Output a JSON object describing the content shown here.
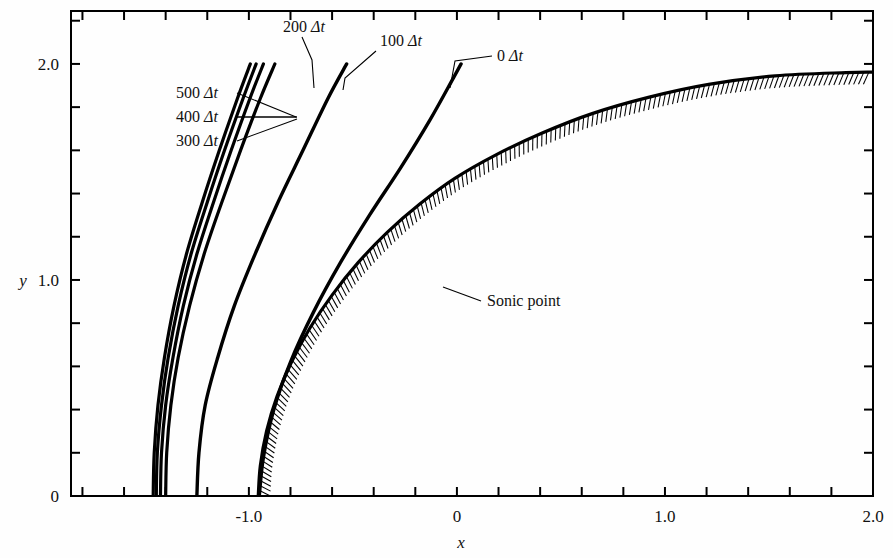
{
  "figure": {
    "background": "#fefefe",
    "ink": "#000000"
  },
  "axes": {
    "x_label": "x",
    "y_label": "y",
    "x_ticklabels": [
      "-1.0",
      "0",
      "1.0",
      "2.0"
    ],
    "x_tickvalues": [
      -1.0,
      0,
      1.0,
      2.0
    ],
    "y_ticklabels": [
      "0",
      "1.0",
      "2.0"
    ],
    "y_tickvalues": [
      0,
      1.0,
      2.0
    ],
    "x_min": -1.855,
    "x_max": 2.0,
    "y_min": 0,
    "y_max": 2.245,
    "x_minor_step": 0.2,
    "y_minor_step": 0.2,
    "frame": true,
    "ticks_inward": false
  },
  "annotations": {
    "sonic_point": "Sonic point",
    "shock_labels": [
      {
        "id": "t0",
        "text": "0 Δt"
      },
      {
        "id": "t100",
        "text": "100 Δt"
      },
      {
        "id": "t200",
        "text": "200 Δt"
      },
      {
        "id": "t300",
        "text": "300 Δt"
      },
      {
        "id": "t400",
        "text": "400 Δt"
      },
      {
        "id": "t500",
        "text": "500 Δt"
      }
    ]
  },
  "chart_data": {
    "type": "line",
    "title": "",
    "xlabel": "x",
    "ylabel": "y",
    "xlim": [
      -1.855,
      2.0
    ],
    "ylim": [
      0,
      2.245
    ],
    "grid": false,
    "legend": "inline-annotations",
    "series": [
      {
        "name": "0 Δt",
        "label_text": "0 Δt",
        "points": [
          [
            -0.95,
            0.0
          ],
          [
            -0.93,
            0.18
          ],
          [
            -0.88,
            0.4
          ],
          [
            -0.8,
            0.62
          ],
          [
            -0.69,
            0.85
          ],
          [
            -0.56,
            1.08
          ],
          [
            -0.42,
            1.3
          ],
          [
            -0.27,
            1.52
          ],
          [
            -0.13,
            1.74
          ],
          [
            -0.02,
            1.93
          ],
          [
            0.02,
            2.0
          ]
        ]
      },
      {
        "name": "100 Δt",
        "label_text": "100 Δt",
        "points": [
          [
            -1.25,
            0.0
          ],
          [
            -1.24,
            0.2
          ],
          [
            -1.21,
            0.42
          ],
          [
            -1.15,
            0.64
          ],
          [
            -1.07,
            0.88
          ],
          [
            -0.97,
            1.12
          ],
          [
            -0.86,
            1.36
          ],
          [
            -0.74,
            1.6
          ],
          [
            -0.62,
            1.84
          ],
          [
            -0.53,
            2.0
          ]
        ]
      },
      {
        "name": "200 Δt",
        "label_text": "200 Δt",
        "points": [
          [
            -1.4,
            0.0
          ],
          [
            -1.395,
            0.2
          ],
          [
            -1.375,
            0.42
          ],
          [
            -1.34,
            0.64
          ],
          [
            -1.285,
            0.88
          ],
          [
            -1.215,
            1.12
          ],
          [
            -1.13,
            1.36
          ],
          [
            -1.04,
            1.6
          ],
          [
            -0.945,
            1.84
          ],
          [
            -0.875,
            2.0
          ]
        ]
      },
      {
        "name": "300 Δt",
        "label_text": "300 Δt",
        "points": [
          [
            -1.425,
            0.0
          ],
          [
            -1.42,
            0.2
          ],
          [
            -1.4,
            0.42
          ],
          [
            -1.365,
            0.64
          ],
          [
            -1.315,
            0.88
          ],
          [
            -1.25,
            1.12
          ],
          [
            -1.17,
            1.36
          ],
          [
            -1.085,
            1.6
          ],
          [
            -0.995,
            1.84
          ],
          [
            -0.93,
            2.0
          ]
        ]
      },
      {
        "name": "400 Δt",
        "label_text": "400 Δt",
        "points": [
          [
            -1.445,
            0.0
          ],
          [
            -1.44,
            0.2
          ],
          [
            -1.42,
            0.42
          ],
          [
            -1.388,
            0.64
          ],
          [
            -1.34,
            0.88
          ],
          [
            -1.278,
            1.12
          ],
          [
            -1.2,
            1.36
          ],
          [
            -1.117,
            1.6
          ],
          [
            -1.028,
            1.84
          ],
          [
            -0.965,
            2.0
          ]
        ]
      },
      {
        "name": "500 Δt",
        "label_text": "500 Δt",
        "points": [
          [
            -1.46,
            0.0
          ],
          [
            -1.455,
            0.2
          ],
          [
            -1.437,
            0.42
          ],
          [
            -1.406,
            0.64
          ],
          [
            -1.36,
            0.88
          ],
          [
            -1.3,
            1.12
          ],
          [
            -1.224,
            1.36
          ],
          [
            -1.142,
            1.6
          ],
          [
            -1.055,
            1.84
          ],
          [
            -0.993,
            2.0
          ]
        ]
      },
      {
        "name": "body surface (hatched)",
        "label_text": "",
        "hatched": true,
        "points": [
          [
            -0.955,
            0.0
          ],
          [
            -0.945,
            0.14
          ],
          [
            -0.915,
            0.3
          ],
          [
            -0.865,
            0.46
          ],
          [
            -0.795,
            0.62
          ],
          [
            -0.705,
            0.78
          ],
          [
            -0.6,
            0.93
          ],
          [
            -0.475,
            1.08
          ],
          [
            -0.335,
            1.22
          ],
          [
            -0.18,
            1.35
          ],
          [
            -0.01,
            1.47
          ],
          [
            0.19,
            1.58
          ],
          [
            0.41,
            1.68
          ],
          [
            0.65,
            1.77
          ],
          [
            0.92,
            1.845
          ],
          [
            1.21,
            1.905
          ],
          [
            1.53,
            1.945
          ],
          [
            1.87,
            1.96
          ],
          [
            2.0,
            1.962
          ]
        ]
      }
    ],
    "point_annotations": [
      {
        "name": "sonic-point",
        "text": "Sonic point",
        "x": -0.41,
        "y": 1.165
      }
    ]
  }
}
